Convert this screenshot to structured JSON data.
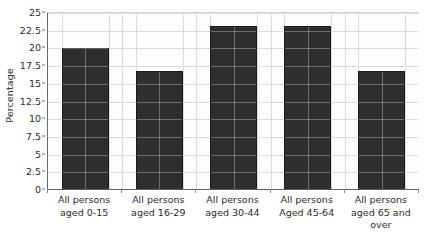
{
  "chart_data": {
    "type": "bar",
    "title": "",
    "xlabel": "",
    "ylabel": "Percentage",
    "categories": [
      "All persons aged 0-15",
      "All persons aged 16-29",
      "All persons aged 30-44",
      "All persons Aged 45-64",
      "All persons aged 65 and over"
    ],
    "category_lines": [
      [
        "All persons",
        "aged 0-15"
      ],
      [
        "All persons",
        "aged 16-29"
      ],
      [
        "All persons",
        "aged 30-44"
      ],
      [
        "All persons",
        "Aged 45-64"
      ],
      [
        "All persons",
        "aged 65 and",
        "over"
      ]
    ],
    "values": [
      20.1,
      16.8,
      23.1,
      23.1,
      16.8
    ],
    "ylim": [
      0,
      25
    ],
    "ytick_labels": [
      "0",
      "2.5",
      "5",
      "7.5",
      "10",
      "12.5",
      "15",
      "17.5",
      "20",
      "22.5",
      "25"
    ],
    "ytick_values": [
      0,
      2.5,
      5,
      7.5,
      10,
      12.5,
      15,
      17.5,
      20,
      22.5,
      25
    ],
    "grid": true,
    "grid_axes": "both",
    "legend": null,
    "bar_color": "#2e2e2e",
    "grid_color": "#dcdcdc",
    "axis_color": "#5e5e5e",
    "background_color": "#ffffff"
  }
}
